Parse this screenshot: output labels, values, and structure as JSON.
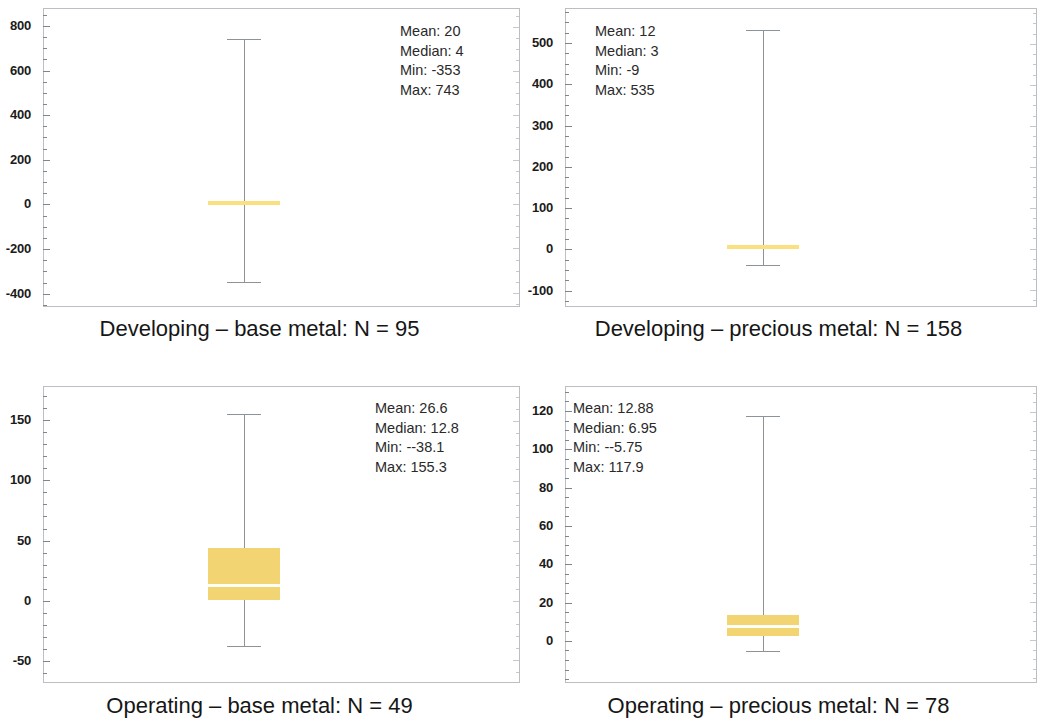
{
  "figure": {
    "kind": "box-and-whisker panel grid",
    "panel_count": 4,
    "box_color": "#f2d472",
    "median_color": "#fefdf6",
    "whisker_color": "#8d9499",
    "axis_color": "#b9bfc4"
  },
  "chart_data": [
    {
      "id": "developing-base-metal",
      "type": "box",
      "title": "Developing – base metal: N = 95",
      "caption": "Developing – base metal: N = 95",
      "group": "Developing",
      "commodity": "base metal",
      "n": 95,
      "xlabel": "",
      "ylabel": "",
      "ylim": [
        -460,
        880
      ],
      "yticks": [
        800,
        600,
        400,
        200,
        0,
        -200,
        -400
      ],
      "ytick_labels": [
        "800",
        "600",
        "400",
        "200",
        "0",
        "-200",
        "-400"
      ],
      "minor_tick_step": 50,
      "grid": false,
      "stats": {
        "mean_label": "Mean: 20",
        "median_label": "Median: 4",
        "min_label": "Min: -353",
        "max_label": "Max: 743",
        "mean": 20,
        "median": 4,
        "min": -353,
        "max": 743
      },
      "box": {
        "q1": 4,
        "q3": 22,
        "median": 4,
        "whisker_low": -353,
        "whisker_high": 743,
        "collapsed": true
      }
    },
    {
      "id": "developing-precious-metal",
      "type": "box",
      "title": "Developing – precious metal: N = 158",
      "caption": "Developing – precious metal: N = 158",
      "group": "Developing",
      "commodity": "precious metal",
      "n": 158,
      "xlabel": "",
      "ylabel": "",
      "ylim": [
        -140,
        585
      ],
      "yticks": [
        500,
        400,
        300,
        200,
        100,
        0,
        -100
      ],
      "ytick_labels": [
        "500",
        "400",
        "300",
        "200",
        "100",
        "0",
        "-100"
      ],
      "minor_tick_step": 25,
      "grid": false,
      "stats": {
        "mean_label": "Mean: 12",
        "median_label": "Median: 3",
        "min_label": "Min: -9",
        "max_label": "Max: 535",
        "mean": 12,
        "median": 3,
        "min": -9,
        "max": 535
      },
      "box": {
        "q1": 3,
        "q3": 9,
        "median": 3,
        "whisker_low": -40,
        "whisker_high": 535,
        "collapsed": true
      }
    },
    {
      "id": "operating-base-metal",
      "type": "box",
      "title": "Operating – base metal: N = 49",
      "caption": "Operating – base metal: N = 49",
      "group": "Operating",
      "commodity": "base metal",
      "n": 49,
      "xlabel": "",
      "ylabel": "",
      "ylim": [
        -68,
        178
      ],
      "yticks": [
        150,
        100,
        50,
        0,
        -50
      ],
      "ytick_labels": [
        "150",
        "100",
        "50",
        "0",
        "-50"
      ],
      "minor_tick_step": 10,
      "grid": false,
      "stats": {
        "mean_label": "Mean: 26.6",
        "median_label": "Median: 12.8",
        "min_label": "Min: --38.1",
        "max_label": "Max: 155.3",
        "mean": 26.6,
        "median": 12.8,
        "min": -38.1,
        "max": 155.3
      },
      "box": {
        "q1": 0.5,
        "q3": 43.5,
        "median": 12.8,
        "whisker_low": -38.1,
        "whisker_high": 155.3,
        "collapsed": false
      }
    },
    {
      "id": "operating-precious-metal",
      "type": "box",
      "title": "Operating – precious metal: N = 78",
      "caption": "Operating – precious metal: N = 78",
      "group": "Operating",
      "commodity": "precious metal",
      "n": 78,
      "xlabel": "",
      "ylabel": "",
      "ylim": [
        -22,
        133
      ],
      "yticks": [
        120,
        100,
        80,
        60,
        40,
        20,
        0
      ],
      "ytick_labels": [
        "120",
        "100",
        "80",
        "60",
        "40",
        "20",
        "0"
      ],
      "minor_tick_step": 5,
      "grid": false,
      "stats": {
        "mean_label": "Mean: 12.88",
        "median_label": "Median: 6.95",
        "min_label": "Min: --5.75",
        "max_label": "Max: 117.9",
        "mean": 12.88,
        "median": 6.95,
        "min": -5.75,
        "max": 117.9
      },
      "box": {
        "q1": 2.2,
        "q3": 13.0,
        "median": 6.95,
        "whisker_low": -5.75,
        "whisker_high": 117.9,
        "collapsed": false
      }
    }
  ]
}
